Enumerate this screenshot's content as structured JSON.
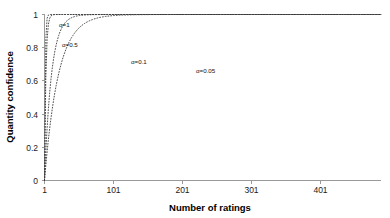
{
  "chart_data": {
    "type": "line",
    "title": "",
    "xlabel": "Number of ratings",
    "ylabel": "Quantity confidence",
    "xlim": [
      1,
      491
    ],
    "ylim": [
      0,
      1
    ],
    "grid": false,
    "legend_position": "inline-annotations",
    "xticks": [
      1,
      101,
      201,
      301,
      401
    ],
    "xtick_labels": [
      "1",
      "101",
      "201",
      "301",
      "401"
    ],
    "yticks": [
      0,
      0.2,
      0.4,
      0.6,
      0.8,
      1
    ],
    "ytick_labels": [
      "0",
      "0.2",
      "0.4",
      "0.6",
      "0.8",
      "1"
    ],
    "line_style": "dotted",
    "formula": "confidence = 1 - exp(-alpha * (n - 1))",
    "series": [
      {
        "name": "alpha-1",
        "label": "α=1",
        "alpha": 1,
        "label_x": 70,
        "label_y": 0.9,
        "x": [
          1,
          2,
          3,
          4,
          5,
          6,
          7,
          8,
          9,
          11,
          21,
          51,
          101,
          201,
          301,
          401,
          491
        ],
        "values": [
          0,
          0.632,
          0.865,
          0.95,
          0.982,
          0.993,
          0.998,
          0.999,
          1,
          1,
          1,
          1,
          1,
          1,
          1,
          1,
          1
        ]
      },
      {
        "name": "alpha-0-5",
        "label": "α=0.5",
        "alpha": 0.5,
        "label_x": 75,
        "label_y": 0.79,
        "x": [
          1,
          2,
          3,
          4,
          5,
          6,
          7,
          9,
          11,
          15,
          21,
          31,
          51,
          101,
          201,
          301,
          401,
          491
        ],
        "values": [
          0,
          0.393,
          0.632,
          0.777,
          0.865,
          0.918,
          0.95,
          0.982,
          0.993,
          0.999,
          1,
          1,
          1,
          1,
          1,
          1,
          1,
          1
        ]
      },
      {
        "name": "alpha-0-1",
        "label": "α=0.1",
        "alpha": 0.1,
        "label_x": 160,
        "label_y": 0.69,
        "x": [
          1,
          3,
          6,
          11,
          21,
          31,
          41,
          51,
          61,
          81,
          101,
          131,
          161,
          201,
          251,
          301,
          351,
          401,
          441,
          491
        ],
        "values": [
          0,
          0.181,
          0.393,
          0.632,
          0.865,
          0.95,
          0.982,
          0.993,
          0.998,
          1,
          1,
          1,
          1,
          1,
          1,
          1,
          1,
          1,
          1,
          1
        ]
      },
      {
        "name": "alpha-0-05",
        "label": "α=0.05",
        "alpha": 0.05,
        "label_x": 255,
        "label_y": 0.6,
        "x": [
          1,
          6,
          11,
          21,
          31,
          51,
          71,
          101,
          131,
          161,
          201,
          251,
          301,
          351,
          401,
          441,
          491
        ],
        "values": [
          0,
          0.221,
          0.394,
          0.632,
          0.777,
          0.918,
          0.97,
          0.993,
          0.998,
          1,
          1,
          1,
          1,
          1,
          1,
          1,
          1
        ]
      }
    ]
  },
  "axes": {
    "x_title": "Number of ratings",
    "y_title": "Quantity confidence"
  }
}
